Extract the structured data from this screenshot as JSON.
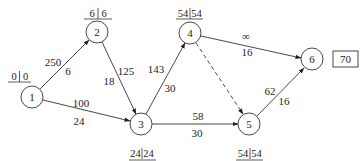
{
  "diagram": {
    "type": "network",
    "nodes": [
      {
        "id": "1",
        "label": "1",
        "x": 32,
        "y": 97,
        "early": "0",
        "late": "0",
        "time_label_pos": "above"
      },
      {
        "id": "2",
        "label": "2",
        "x": 97,
        "y": 32,
        "early": "6",
        "late": "6",
        "time_label_pos": "above"
      },
      {
        "id": "3",
        "label": "3",
        "x": 141,
        "y": 124,
        "early": "24",
        "late": "24",
        "time_label_pos": "below"
      },
      {
        "id": "4",
        "label": "4",
        "x": 190,
        "y": 33,
        "early": "54",
        "late": "54",
        "time_label_pos": "above"
      },
      {
        "id": "5",
        "label": "5",
        "x": 249,
        "y": 124,
        "early": "54",
        "late": "54",
        "time_label_pos": "below"
      },
      {
        "id": "6",
        "label": "6",
        "x": 312,
        "y": 59,
        "early": "",
        "late": "",
        "time_label_pos": "none"
      }
    ],
    "edges": [
      {
        "from": "1",
        "to": "2",
        "cost": "250",
        "duration": "6",
        "style": "solid"
      },
      {
        "from": "1",
        "to": "3",
        "cost": "100",
        "duration": "24",
        "style": "solid"
      },
      {
        "from": "2",
        "to": "3",
        "cost": "125",
        "duration": "18",
        "style": "solid"
      },
      {
        "from": "3",
        "to": "4",
        "cost": "143",
        "duration": "30",
        "style": "solid"
      },
      {
        "from": "3",
        "to": "5",
        "cost": "58",
        "duration": "30",
        "style": "solid"
      },
      {
        "from": "4",
        "to": "6",
        "cost": "∞",
        "duration": "16",
        "style": "solid"
      },
      {
        "from": "4",
        "to": "5",
        "cost": "",
        "duration": "",
        "style": "dashed"
      },
      {
        "from": "5",
        "to": "6",
        "cost": "62",
        "duration": "16",
        "style": "solid"
      }
    ],
    "result_box": {
      "label": "70",
      "x": 345,
      "y": 59
    }
  },
  "labels": {
    "n1": "1",
    "n2": "2",
    "n3": "3",
    "n4": "4",
    "n5": "5",
    "n6": "6",
    "t1a": "0",
    "t1b": "0",
    "t2a": "6",
    "t2b": "6",
    "t3a": "24",
    "t3b": "24",
    "t4a": "54",
    "t4b": "54",
    "t5a": "54",
    "t5b": "54",
    "e12c": "250",
    "e12d": "6",
    "e13c": "100",
    "e13d": "24",
    "e23c": "125",
    "e23d": "18",
    "e34c": "143",
    "e34d": "30",
    "e35c": "58",
    "e35d": "30",
    "e46c": "∞",
    "e46d": "16",
    "e56c": "62",
    "e56d": "16",
    "result": "70"
  }
}
